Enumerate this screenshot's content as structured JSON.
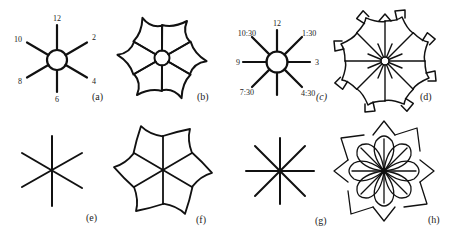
{
  "figure": {
    "panels": [
      {
        "id": "a",
        "caption": "(a)",
        "kind": "clock-spokes",
        "spokes": 6,
        "center_circle": true,
        "labels": [
          "12",
          "2",
          "4",
          "6",
          "8",
          "10"
        ]
      },
      {
        "id": "b",
        "caption": "(b)",
        "kind": "flower",
        "petals": 6,
        "center_circle": true
      },
      {
        "id": "c",
        "caption": "(c)",
        "kind": "clock-spokes",
        "spokes": 8,
        "center_circle": true,
        "labels": [
          "12",
          "1:30",
          "3",
          "4:30",
          "7:30",
          "9",
          "10:30"
        ]
      },
      {
        "id": "d",
        "caption": "(d)",
        "kind": "rosette",
        "petals": 8,
        "inner_rays": 16,
        "center_circle": true
      },
      {
        "id": "e",
        "caption": "(e)",
        "kind": "asterisk",
        "spokes": 6
      },
      {
        "id": "f",
        "caption": "(f)",
        "kind": "flower",
        "petals": 6,
        "center_circle": false
      },
      {
        "id": "g",
        "caption": "(g)",
        "kind": "asterisk",
        "spokes": 8
      },
      {
        "id": "h",
        "caption": "(h)",
        "kind": "interlaced-rosette",
        "petals": 8
      }
    ],
    "colors": {
      "ink": "#111111",
      "background": "#ffffff"
    }
  }
}
